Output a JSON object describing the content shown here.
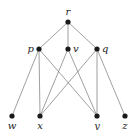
{
  "diagram": {
    "type": "hasse-diagram",
    "nodes": [
      {
        "id": "r",
        "label": "r",
        "x": 68,
        "y": 22,
        "label_pos": "above"
      },
      {
        "id": "p",
        "label": "p",
        "x": 39,
        "y": 49,
        "label_pos": "left"
      },
      {
        "id": "v",
        "label": "v",
        "x": 68,
        "y": 49,
        "label_pos": "right"
      },
      {
        "id": "q",
        "label": "q",
        "x": 97,
        "y": 49,
        "label_pos": "right"
      },
      {
        "id": "w",
        "label": "w",
        "x": 12,
        "y": 116,
        "label_pos": "below"
      },
      {
        "id": "x",
        "label": "x",
        "x": 40,
        "y": 116,
        "label_pos": "below"
      },
      {
        "id": "y",
        "label": "y",
        "x": 97,
        "y": 116,
        "label_pos": "below"
      },
      {
        "id": "z",
        "label": "z",
        "x": 125,
        "y": 116,
        "label_pos": "below"
      }
    ],
    "edges": [
      [
        "r",
        "p"
      ],
      [
        "r",
        "v"
      ],
      [
        "r",
        "q"
      ],
      [
        "p",
        "w"
      ],
      [
        "p",
        "x"
      ],
      [
        "p",
        "y"
      ],
      [
        "v",
        "x"
      ],
      [
        "v",
        "y"
      ],
      [
        "q",
        "x"
      ],
      [
        "q",
        "y"
      ],
      [
        "q",
        "z"
      ]
    ],
    "colors": {
      "node": "#1a1a1a",
      "edge": "#777777",
      "label": "#222222"
    }
  }
}
